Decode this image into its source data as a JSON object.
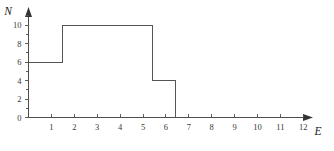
{
  "chart_data": {
    "type": "line",
    "title": "",
    "subtitle": "",
    "xlabel": "E",
    "ylabel": "N",
    "xlim": [
      0,
      13.2
    ],
    "ylim": [
      0,
      11.4
    ],
    "grid": false,
    "legend": null,
    "x_ticks": [
      1,
      2,
      3,
      4,
      5,
      6,
      7,
      8,
      9,
      10,
      11,
      12
    ],
    "x_tick_labels": [
      "1",
      "2",
      "3",
      "4",
      "5",
      "6",
      "7",
      "8",
      "9",
      "10",
      "11",
      "12"
    ],
    "y_ticks": [
      0,
      1,
      2,
      3,
      4,
      5,
      6,
      7,
      8,
      9,
      10,
      11
    ],
    "y_tick_labels": [
      "0",
      "",
      "2",
      "",
      "4",
      "",
      "6",
      "",
      "8",
      "",
      "10",
      ""
    ],
    "y_labeled_ticks": [
      0,
      2,
      4,
      6,
      8,
      10
    ],
    "step_segments": [
      {
        "x_start": 0.0,
        "x_end": 1.5,
        "value": 6
      },
      {
        "x_start": 1.5,
        "x_end": 5.4,
        "value": 10
      },
      {
        "x_start": 5.4,
        "x_end": 6.4,
        "value": 4
      },
      {
        "x_start": 6.4,
        "x_end": 6.4,
        "value": 0
      }
    ],
    "points": [
      {
        "x": 0.0,
        "y": 6
      },
      {
        "x": 1.5,
        "y": 6
      },
      {
        "x": 1.5,
        "y": 10
      },
      {
        "x": 5.4,
        "y": 10
      },
      {
        "x": 5.4,
        "y": 4
      },
      {
        "x": 6.4,
        "y": 4
      },
      {
        "x": 6.4,
        "y": 0
      }
    ],
    "annotations": []
  },
  "axes": {
    "y_axis_name": "N",
    "x_axis_name": "E"
  }
}
